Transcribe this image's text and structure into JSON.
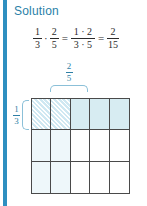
{
  "heading": "Solution",
  "colors": {
    "accent_bar": "#2e8fc0",
    "heading": "#2a7fa8",
    "brace": "#8bc0d8",
    "label": "#2e7fa5",
    "grid_line": "#4a4a4a",
    "shade_strong": "#d7ecf2",
    "shade_soft": "#eef7fa",
    "hatch": "#cfe8f2"
  },
  "equation": {
    "term1": {
      "num": "1",
      "den": "3"
    },
    "op_multiply": "·",
    "term2": {
      "num": "2",
      "den": "5"
    },
    "op_equals_1": "=",
    "term3": {
      "num": "1 · 2",
      "den": "3 · 5"
    },
    "op_equals_2": "=",
    "term4": {
      "num": "2",
      "den": "15"
    }
  },
  "diagram": {
    "top_label": {
      "num": "2",
      "den": "5"
    },
    "left_label": {
      "num": "1",
      "den": "3"
    },
    "columns": 5,
    "rows": 3,
    "cells": [
      [
        "hatch",
        "hatch",
        "tint-strong",
        "tint-strong",
        "tint-strong"
      ],
      [
        "tint-soft",
        "tint-soft",
        "tint-none",
        "tint-none",
        "tint-none"
      ],
      [
        "tint-soft",
        "tint-soft",
        "tint-none",
        "tint-none",
        "tint-none"
      ]
    ]
  }
}
